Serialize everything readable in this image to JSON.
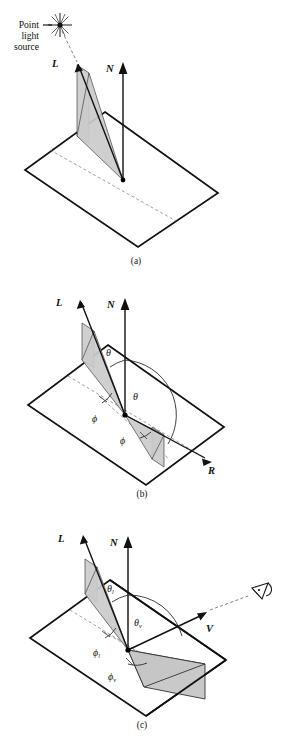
{
  "figure": {
    "title_visible": false,
    "background_color": "#ffffff",
    "line_color": "#111111",
    "shade_color": "#cbcbcb",
    "panels": [
      {
        "id": "a",
        "caption": "(a)",
        "annotation": {
          "source_label_line1": "Point",
          "source_label_line2": "light",
          "source_label_line3": "source",
          "icon": "point-light-star"
        },
        "vectors": [
          {
            "name": "L",
            "label": "L"
          },
          {
            "name": "N",
            "label": "N"
          }
        ],
        "angles": []
      },
      {
        "id": "b",
        "caption": "(b)",
        "vectors": [
          {
            "name": "L",
            "label": "L"
          },
          {
            "name": "N",
            "label": "N"
          },
          {
            "name": "R",
            "label": "R"
          }
        ],
        "angles": [
          {
            "name": "theta-incident",
            "glyph": "θ",
            "sub": ""
          },
          {
            "name": "theta-reflect",
            "glyph": "θ",
            "sub": ""
          },
          {
            "name": "phi-incident",
            "glyph": "ϕ",
            "sub": ""
          },
          {
            "name": "phi-reflect",
            "glyph": "ϕ",
            "sub": ""
          }
        ]
      },
      {
        "id": "c",
        "caption": "(c)",
        "vectors": [
          {
            "name": "L",
            "label": "L"
          },
          {
            "name": "N",
            "label": "N"
          },
          {
            "name": "V",
            "label": "V"
          }
        ],
        "angles": [
          {
            "name": "theta-l",
            "glyph": "θ",
            "sub": "l"
          },
          {
            "name": "theta-v",
            "glyph": "θ",
            "sub": "v"
          },
          {
            "name": "phi-l",
            "glyph": "ϕ",
            "sub": "l"
          },
          {
            "name": "phi-v",
            "glyph": "ϕ",
            "sub": "v"
          }
        ],
        "icon": "eye-viewer"
      }
    ]
  }
}
